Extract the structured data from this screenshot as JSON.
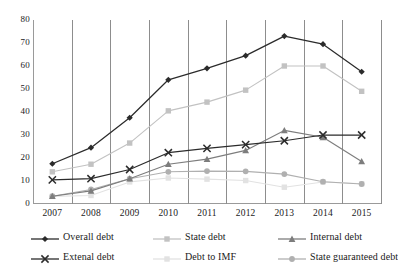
{
  "chart_data": {
    "type": "line",
    "title": "",
    "xlabel": "",
    "ylabel": "",
    "categories": [
      "2007",
      "2008",
      "2009",
      "2010",
      "2011",
      "2012",
      "2013",
      "2014",
      "2015"
    ],
    "ylim": [
      0,
      80
    ],
    "yticks": [
      0,
      10,
      20,
      30,
      40,
      50,
      60,
      70,
      80
    ],
    "grid": "vertical",
    "legend_position": "bottom",
    "series": [
      {
        "name": "Overall debt",
        "color": "#2b2b2b",
        "marker": "diamond",
        "values": [
          17.5,
          24.5,
          37.5,
          54.0,
          59.0,
          64.5,
          73.0,
          69.5,
          57.5
        ]
      },
      {
        "name": "State debt",
        "color": "#c2c2c2",
        "marker": "square",
        "values": [
          14.0,
          17.3,
          26.5,
          40.5,
          44.3,
          49.5,
          60.0,
          60.0,
          49.0
        ]
      },
      {
        "name": "Internal debt",
        "color": "#7d7d7d",
        "marker": "triangle",
        "values": [
          3.4,
          5.7,
          11.0,
          17.3,
          19.5,
          23.3,
          32.0,
          29.0,
          18.5
        ]
      },
      {
        "name": "Extenal debt",
        "color": "#2b2b2b",
        "marker": "x",
        "values": [
          10.5,
          11.0,
          15.0,
          22.3,
          24.2,
          25.8,
          27.5,
          30.0,
          30.0
        ]
      },
      {
        "name": "Debt to IMF",
        "color": "#e2e2e2",
        "marker": "square",
        "values": [
          3.3,
          3.7,
          9.6,
          11.3,
          10.8,
          10.2,
          7.3,
          9.6,
          8.8
        ]
      },
      {
        "name": "State guaranteed debt",
        "color": "#b0b0b0",
        "marker": "circle",
        "values": [
          3.4,
          6.3,
          11.0,
          14.0,
          14.3,
          14.2,
          13.0,
          9.7,
          8.7
        ]
      }
    ]
  },
  "legend": {
    "items": [
      {
        "label": "Overall debt"
      },
      {
        "label": "State debt"
      },
      {
        "label": "Internal debt"
      },
      {
        "label": "Extenal debt"
      },
      {
        "label": "Debt to IMF"
      },
      {
        "label": "State guaranteed debt"
      }
    ]
  },
  "axis": {
    "y_labels": [
      "80",
      "70",
      "60",
      "50",
      "40",
      "30",
      "20",
      "10",
      "0"
    ],
    "x_labels": [
      "2007",
      "2008",
      "2009",
      "2010",
      "2011",
      "2012",
      "2013",
      "2014",
      "2015"
    ]
  }
}
